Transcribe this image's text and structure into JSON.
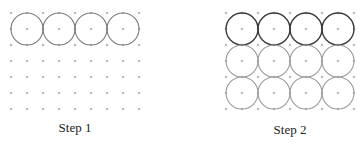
{
  "panels": [
    {
      "label": "Step 1",
      "grid": {
        "columns": 9,
        "rows": 7
      },
      "circles": [
        {
          "row": 0,
          "col": 0,
          "shade": "mid"
        },
        {
          "row": 0,
          "col": 1,
          "shade": "mid"
        },
        {
          "row": 0,
          "col": 2,
          "shade": "mid"
        },
        {
          "row": 0,
          "col": 3,
          "shade": "mid"
        }
      ]
    },
    {
      "label": "Step 2",
      "grid": {
        "columns": 9,
        "rows": 7
      },
      "circles": [
        {
          "row": 0,
          "col": 0,
          "shade": "dark"
        },
        {
          "row": 0,
          "col": 1,
          "shade": "dark"
        },
        {
          "row": 0,
          "col": 2,
          "shade": "dark"
        },
        {
          "row": 0,
          "col": 3,
          "shade": "dark"
        },
        {
          "row": 1,
          "col": 0,
          "shade": "light"
        },
        {
          "row": 1,
          "col": 1,
          "shade": "light"
        },
        {
          "row": 1,
          "col": 2,
          "shade": "light"
        },
        {
          "row": 1,
          "col": 3,
          "shade": "light"
        },
        {
          "row": 2,
          "col": 0,
          "shade": "light"
        },
        {
          "row": 2,
          "col": 1,
          "shade": "light"
        },
        {
          "row": 2,
          "col": 2,
          "shade": "light"
        },
        {
          "row": 2,
          "col": 3,
          "shade": "light"
        }
      ]
    }
  ]
}
